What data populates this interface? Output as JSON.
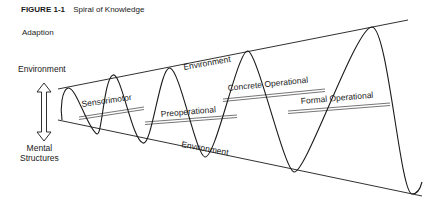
{
  "caption": {
    "figure_number": "FIGURE 1-1",
    "title": "Spiral of Knowledge"
  },
  "axis": {
    "heading": "Adaption",
    "top_label": "Environment",
    "bottom_label_line1": "Mental",
    "bottom_label_line2": "Structures",
    "arrow": "double-headed-vertical-arrow"
  },
  "boundaries": {
    "top_label": "Environment",
    "bottom_label": "Environment"
  },
  "stages": [
    {
      "label": "Sensorimotor"
    },
    {
      "label": "Preoperational"
    },
    {
      "label": "Concrete Operational"
    },
    {
      "label": "Formal Operational"
    }
  ],
  "colors": {
    "ink": "#1a1a1a",
    "background": "#ffffff"
  }
}
